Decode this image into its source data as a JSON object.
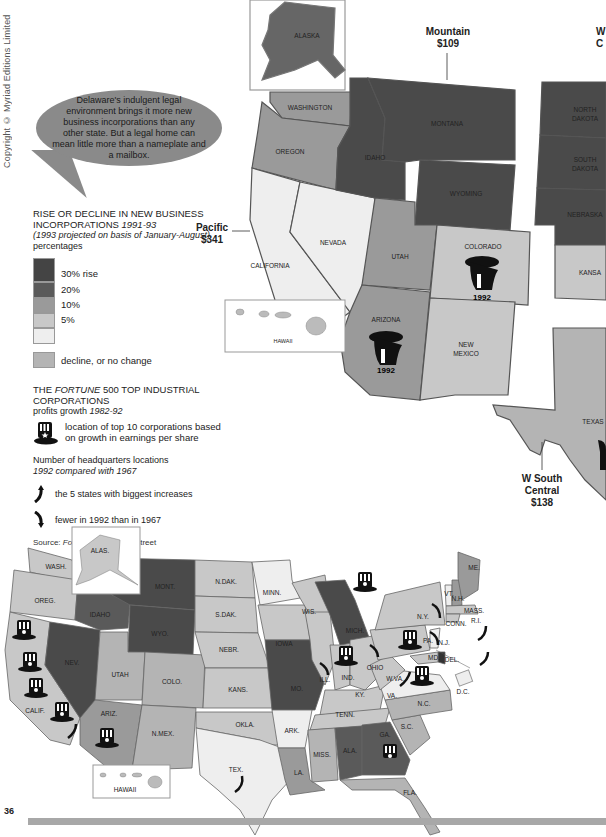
{
  "copyright": "Copyright © Myriad Editions Limited",
  "page_number": "36",
  "callout": {
    "text": "Delaware's indulgent legal environment brings it more new business incorporations than any other state. But a legal home can mean little more than a nameplate and a mailbox."
  },
  "colors": {
    "rise_30": "#4a4a4a",
    "rise_20": "#5a5a5a",
    "rise_10": "#9a9a9a",
    "rise_5": "#c8c8c8",
    "rise_0": "#eeeeee",
    "decline": "#b4b4b4",
    "bubble": "#8a8a8a",
    "bottom_bar": "#a8a8a8"
  },
  "legend": {
    "title_line1": "RISE OR DECLINE IN NEW BUSINESS",
    "title_line2": "INCORPORATIONS",
    "title_years": "1991-93",
    "subtitle_italic": "(1993 projected on basis of January-August)",
    "subtitle_plain": "percentages",
    "scale": [
      {
        "label": "30% rise",
        "color": "#4a4a4a"
      },
      {
        "label": "20%",
        "color": "#5a5a5a"
      },
      {
        "label": "10%",
        "color": "#9a9a9a"
      },
      {
        "label": "5%",
        "color": "#c8c8c8"
      },
      {
        "label": "",
        "color": "#eeeeee"
      }
    ],
    "decline_label": "decline, or no change",
    "fortune_title_pre": "THE",
    "fortune_title_italic": "FORTUNE",
    "fortune_title_post": "500 TOP INDUSTRIAL CORPORATIONS",
    "fortune_sub_plain": "profits growth",
    "fortune_sub_italic": "1982-92",
    "hat_desc": "location of top 10 corporations based on growth in earnings per share",
    "hq_title": "Number of headquarters locations",
    "hq_sub": "1992 compared with 1967",
    "arrow_up_desc": "the 5 states with biggest increases",
    "arrow_down_desc": "fewer in 1992 than in 1967",
    "source_label": "Source:",
    "source_italic": "Fortune",
    "source_rest": "; Dun & Bradstreet"
  },
  "regions": {
    "mountain": {
      "name": "Mountain",
      "value": "$109"
    },
    "pacific": {
      "name": "Pacific",
      "value": "$341"
    },
    "wsc": {
      "name_line1": "W South",
      "name_line2": "Central",
      "value": "$138"
    },
    "wnc_partial": {
      "name": "W",
      "value": "C"
    }
  },
  "upper_map": {
    "states": {
      "alaska": "ALASKA",
      "washington": "WASHINGTON",
      "oregon": "OREGON",
      "california": "CALIFORNIA",
      "nevada": "NEVADA",
      "idaho": "IDAHO",
      "montana": "MONTANA",
      "wyoming": "WYOMING",
      "utah": "UTAH",
      "colorado": "COLORADO",
      "arizona": "ARIZONA",
      "new_mexico_1": "NEW",
      "new_mexico_2": "MEXICO",
      "hawaii": "HAWAII",
      "north_dakota_1": "NORTH",
      "north_dakota_2": "DAKOTA",
      "south_dakota_1": "SOUTH",
      "south_dakota_2": "DAKOTA",
      "nebraska": "NEBRASKA",
      "kansas": "KANSA",
      "texas": "TEXAS"
    },
    "hat_years": {
      "colorado": "1992",
      "arizona": "1992"
    }
  },
  "lower_map": {
    "states": {
      "alas": "ALAS.",
      "wash": "WASH.",
      "oreg": "OREG.",
      "calif": "CALIF.",
      "nev": "NEV.",
      "idaho": "IDAHO",
      "mont": "MONT.",
      "wyo": "WYO.",
      "utah": "UTAH",
      "colo": "COLO.",
      "ariz": "ARIZ.",
      "nmex": "N.MEX.",
      "ndak": "N.DAK.",
      "sdak": "S.DAK.",
      "nebr": "NEBR.",
      "kans": "KANS.",
      "okla": "OKLA.",
      "tex": "TEX.",
      "minn": "MINN.",
      "iowa": "IOWA",
      "mo": "MO.",
      "ark": "ARK.",
      "la": "LA.",
      "wis": "WIS.",
      "ill": "ILL.",
      "mich": "MICH.",
      "ind": "IND.",
      "ohio": "OHIO",
      "ky": "KY.",
      "tenn": "TENN.",
      "miss": "MISS.",
      "ala": "ALA.",
      "ga": "GA.",
      "fla": "FLA.",
      "sc": "S.C.",
      "nc": "N.C.",
      "va": "VA.",
      "wva": "W.VA.",
      "pa": "PA.",
      "ny": "N.Y.",
      "vt": "VT.",
      "nh": "N.H.",
      "me": "ME.",
      "mass": "MASS.",
      "conn": "CONN.",
      "ri": "R.I.",
      "nj": "N.J.",
      "del": "DEL.",
      "md": "MD.",
      "dc": "D.C.",
      "hawaii": "HAWAII"
    }
  }
}
